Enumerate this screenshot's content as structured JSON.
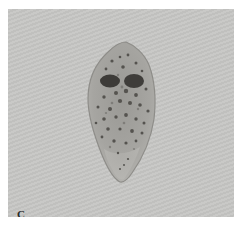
{
  "figure": {
    "panel_label": "C",
    "colors": {
      "background": "#c6c6c4",
      "cell_body": "#a4a39f",
      "cell_outline": "#8e8d89",
      "nuclei": "#3d3b38",
      "granules": "#55534f"
    }
  }
}
